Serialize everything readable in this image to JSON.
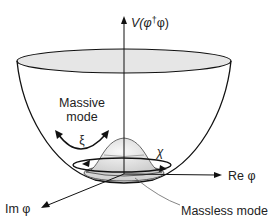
{
  "diagram": {
    "labels": {
      "potential_axis": "V(φ†φ)",
      "potential_axis_v": "V(φ",
      "potential_axis_dagger": "†",
      "potential_axis_rest": "φ)",
      "massive_line1": "Massive",
      "massive_line2": "mode",
      "xi": "ξ",
      "chi": "χ",
      "re_axis": "Re φ",
      "im_axis": "Im φ",
      "massless": "Massless mode"
    },
    "colors": {
      "stroke": "#111111",
      "rim_fill": "#e6e6e6",
      "hump_fill_light": "#f4f4f4",
      "hump_fill_dark": "#c8c8c8",
      "text": "#222222",
      "leader_line": "#666666"
    }
  }
}
